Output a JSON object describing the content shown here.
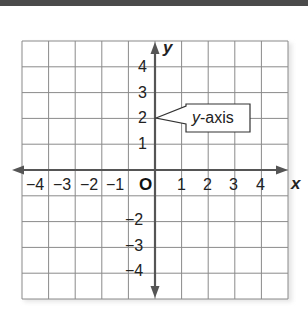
{
  "diagram": {
    "type": "coordinate-plane",
    "grid": {
      "columns": 10,
      "rows": 10,
      "x_range": [
        -5,
        5
      ],
      "y_range": [
        -5,
        5
      ]
    },
    "axes": {
      "x": {
        "name": "x",
        "tick_labels": [
          "−4",
          "−3",
          "−2",
          "−1",
          "1",
          "2",
          "3",
          "4"
        ]
      },
      "y": {
        "name": "y",
        "tick_labels": [
          "4",
          "3",
          "2",
          "1",
          "−2",
          "−3",
          "−4"
        ]
      }
    },
    "origin_label": "O",
    "callout": {
      "italic_part": "y",
      "rest": "-axis",
      "points_to": {
        "x": 0,
        "y": 2
      }
    },
    "colors": {
      "grid": "#8a8a8a",
      "axis": "#555555",
      "text": "#222222",
      "topbar": "#4b4b4b"
    }
  }
}
